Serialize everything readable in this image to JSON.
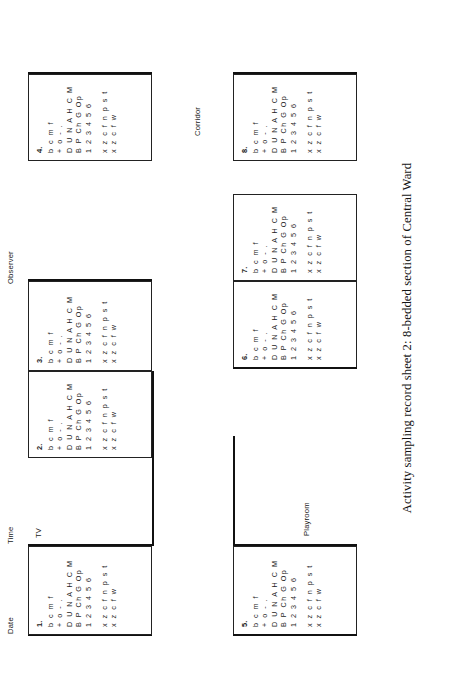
{
  "sheet": {
    "caption": "Activity sampling record sheet 2: 8-bedded section of Central Ward",
    "fields": {
      "date_label": "Date",
      "time_label": "Time",
      "observer_label": "Observer"
    },
    "plan_labels": {
      "tv": "TV",
      "corridor": "Corridor",
      "playroom": "Playroom"
    },
    "code_key": {
      "line1": "b c m f",
      "line2": "+ o - .",
      "line3": "D U N A H C M",
      "line4": "B P Ch G Op",
      "line5": "1 2 3 4 5 6",
      "line6": "x z c f n p s t",
      "line7": "x z c f w"
    },
    "beds": [
      {
        "number": "1."
      },
      {
        "number": "2."
      },
      {
        "number": "3."
      },
      {
        "number": "4."
      },
      {
        "number": "5."
      },
      {
        "number": "6."
      },
      {
        "number": "7."
      },
      {
        "number": "8."
      }
    ]
  }
}
